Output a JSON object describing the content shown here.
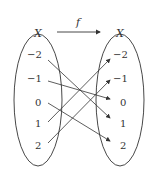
{
  "function_label": "f",
  "domain_set": {
    "label": "X",
    "elements": [
      "−2",
      "−1",
      "0",
      "1",
      "2"
    ]
  },
  "codomain_set": {
    "label": "X",
    "elements": [
      "−2",
      "−1",
      "0",
      "1",
      "2"
    ]
  },
  "mapping": [
    {
      "from": "−2",
      "to": "1"
    },
    {
      "from": "−1",
      "to": "0"
    },
    {
      "from": "0",
      "to": "2"
    },
    {
      "from": "1",
      "to": "−2"
    },
    {
      "from": "2",
      "to": "−1"
    }
  ],
  "colors": {
    "stroke": "#333333"
  }
}
